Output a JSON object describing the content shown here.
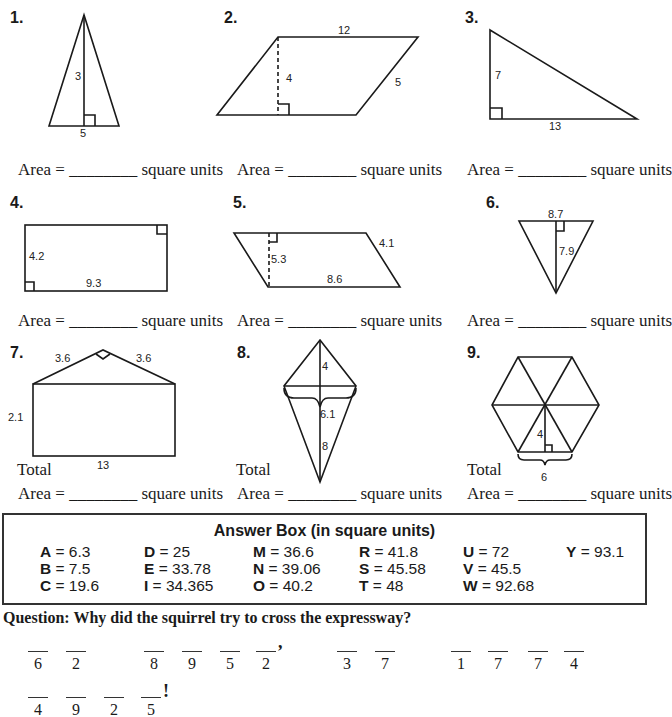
{
  "worksheet": {
    "top_text_cutoff": "Compute the area of each figure. Write the answers in the blanks.",
    "area_prefix": "Area = ",
    "area_blank": "________",
    "area_suffix": " square units",
    "total_label": "Total",
    "problems": [
      {
        "number": "1.",
        "shape": "isosceles triangle",
        "labels": {
          "height": "3",
          "base": "5"
        }
      },
      {
        "number": "2.",
        "shape": "parallelogram",
        "labels": {
          "top": "12",
          "height": "4",
          "side": "5"
        }
      },
      {
        "number": "3.",
        "shape": "right triangle",
        "labels": {
          "height": "7",
          "base": "13"
        }
      },
      {
        "number": "4.",
        "shape": "rectangle",
        "labels": {
          "height": "4.2",
          "base": "9.3"
        }
      },
      {
        "number": "5.",
        "shape": "parallelogram",
        "labels": {
          "height": "5.3",
          "side": "4.1",
          "base": "8.6"
        }
      },
      {
        "number": "6.",
        "shape": "inverted triangle",
        "labels": {
          "base": "8.7",
          "height": "7.9"
        }
      },
      {
        "number": "7.",
        "shape": "rectangle with triangle roof",
        "labels": {
          "roof_left": "3.6",
          "roof_right": "3.6",
          "height": "2.1",
          "base": "13"
        }
      },
      {
        "number": "8.",
        "shape": "kite",
        "labels": {
          "top": "4",
          "width": "6.1",
          "bottom": "8"
        }
      },
      {
        "number": "9.",
        "shape": "regular hexagon",
        "labels": {
          "apothem": "4",
          "side": "6"
        }
      }
    ]
  },
  "answer_box": {
    "title": "Answer Box (in square units)",
    "columns": [
      [
        {
          "letter": "A",
          "value": " = 6.3"
        },
        {
          "letter": "B",
          "value": " = 7.5"
        },
        {
          "letter": "C",
          "value": " = 19.6"
        }
      ],
      [
        {
          "letter": "D",
          "value": " = 25"
        },
        {
          "letter": "E",
          "value": " = 33.78"
        },
        {
          "letter": "I",
          "value": " = 34.365"
        }
      ],
      [
        {
          "letter": "M",
          "value": " = 36.6"
        },
        {
          "letter": "N",
          "value": " = 39.06"
        },
        {
          "letter": "O",
          "value": " = 40.2"
        }
      ],
      [
        {
          "letter": "R",
          "value": " = 41.8"
        },
        {
          "letter": "S",
          "value": " = 45.58"
        },
        {
          "letter": "T",
          "value": " = 48"
        }
      ],
      [
        {
          "letter": "U",
          "value": " = 72"
        },
        {
          "letter": "V",
          "value": " = 45.5"
        },
        {
          "letter": "W",
          "value": " = 92.68"
        }
      ],
      [
        {
          "letter": "Y",
          "value": " = 93.1"
        }
      ]
    ]
  },
  "question": {
    "text": "Question:  Why did the squirrel try to cross the expressway?",
    "line1": [
      {
        "words": [
          "6",
          "2"
        ]
      },
      {
        "words": [
          "8",
          "9",
          "5",
          "2"
        ],
        "punct": ","
      },
      {
        "words": [
          "3",
          "7"
        ]
      },
      {
        "words": [
          "1",
          "7",
          "7",
          "4"
        ]
      }
    ],
    "line2": [
      {
        "words": [
          "4",
          "9",
          "2",
          "5"
        ],
        "punct": "!"
      }
    ]
  }
}
